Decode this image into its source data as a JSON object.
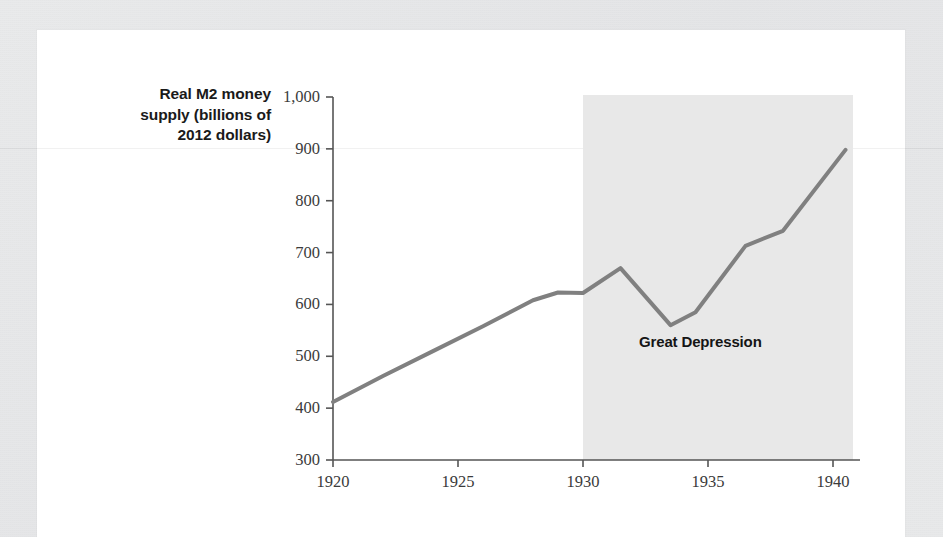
{
  "figure": {
    "background_color": "#ffffff",
    "page_margin_color": "#e6e7e8"
  },
  "chart_data": {
    "type": "line",
    "title": "",
    "ylabel": "Real M2 money supply (billions of 2012 dollars)",
    "xlabel": "",
    "xlim": [
      1919.4,
      1941.0
    ],
    "ylim": [
      300,
      1000
    ],
    "grid": false,
    "legend": null,
    "line_color": "#808080",
    "line_width": 4,
    "xticks": [
      1920,
      1925,
      1930,
      1935,
      1940
    ],
    "xtick_labels": [
      "1920",
      "1925",
      "1930",
      "1935",
      "1940"
    ],
    "yticks": [
      300,
      400,
      500,
      600,
      700,
      800,
      900,
      1000
    ],
    "ytick_labels": [
      "300",
      "400",
      "500",
      "600",
      "700",
      "800",
      "900",
      "1,000"
    ],
    "series": [
      {
        "name": "Real M2 money supply",
        "x": [
          1920.0,
          1922.0,
          1924.0,
          1926.0,
          1928.0,
          1929.0,
          1930.0,
          1931.5,
          1933.5,
          1934.5,
          1936.5,
          1938.0,
          1940.5
        ],
        "values": [
          412,
          462,
          510,
          558,
          608,
          623,
          622,
          670,
          560,
          585,
          713,
          742,
          898
        ]
      }
    ],
    "shaded_regions": [
      {
        "label": "Great Depression",
        "x_start": 1930.0,
        "x_end": 1940.8,
        "color": "#e8e8e8",
        "label_x": 1935.2,
        "label_y": 527
      }
    ],
    "annotations": [
      {
        "text": "Great Depression"
      }
    ]
  },
  "axis_title": {
    "line1": "Real M2 money",
    "line2": "supply (billions of",
    "line3": "2012 dollars)"
  }
}
